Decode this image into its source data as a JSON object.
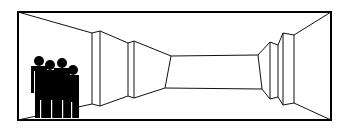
{
  "illustration": {
    "subject": "perspective corridor room with group of four people",
    "colors": {
      "line": "#000000",
      "background": "#ffffff",
      "figures": "#000000"
    },
    "people_count": 4
  }
}
